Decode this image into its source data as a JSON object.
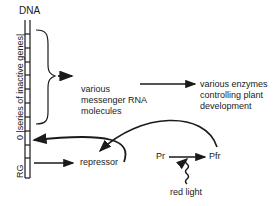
{
  "diagram": {
    "dna_label": "DNA",
    "inactive_genes_label": "0 |series of inactive genes|",
    "rg_label": "RG",
    "mrna_label": [
      "various",
      "messenger RNA",
      "molecules"
    ],
    "enzymes_label": [
      "various enzymes",
      "controlling plant",
      "development"
    ],
    "repressor_label": "repressor",
    "pr_label": "Pr",
    "pfr_label": "Pfr",
    "red_light_label": "red light",
    "colors": {
      "ink": "#1a1a1a",
      "background": "#ffffff"
    }
  }
}
